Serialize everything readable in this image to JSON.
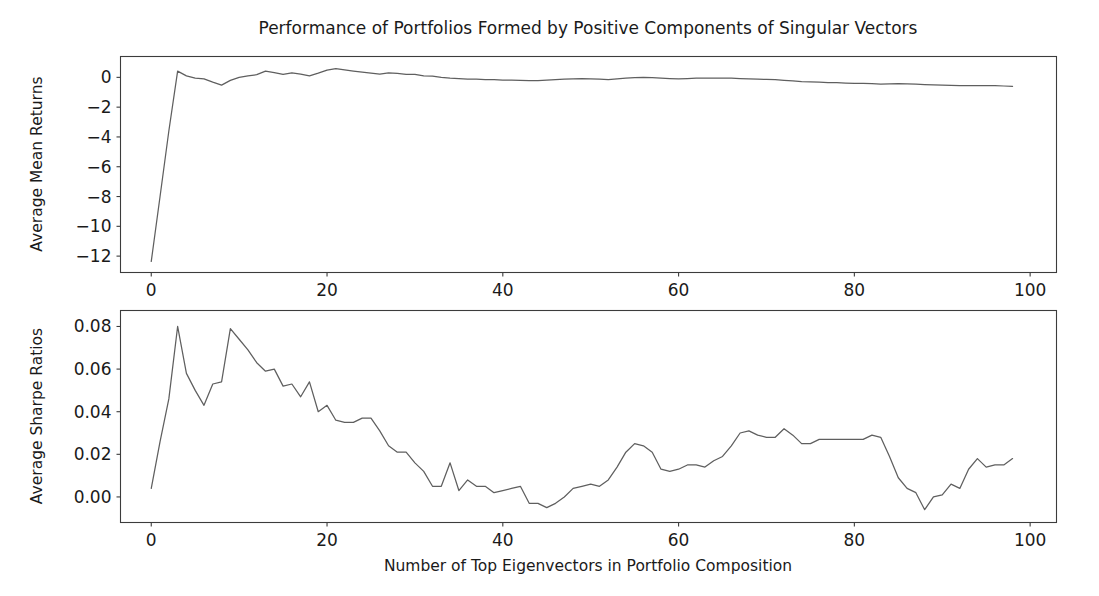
{
  "figure": {
    "title": "Performance of Portfolios Formed by Positive Components of Singular Vectors",
    "background_color": "#ffffff",
    "line_color": "#5f5f5f",
    "axis_color": "#3c3c3c"
  },
  "chart_data": [
    {
      "type": "line",
      "panel": "top",
      "title": "Performance of Portfolios Formed by Positive Components of Singular Vectors",
      "xlabel": "",
      "ylabel": "Average Mean Returns",
      "xlim": [
        -3.5,
        103
      ],
      "ylim": [
        -13.1,
        1.4
      ],
      "xticks": [
        0,
        20,
        40,
        60,
        80,
        100
      ],
      "xticklabels": [
        "0",
        "20",
        "40",
        "60",
        "80",
        "100"
      ],
      "yticks": [
        0,
        -2,
        -4,
        -6,
        -8,
        -10,
        -12
      ],
      "yticklabels": [
        "0",
        "−2",
        "−4",
        "−6",
        "−8",
        "−10",
        "−12"
      ],
      "grid": false,
      "legend": false,
      "series": [
        {
          "name": "Average Mean Returns",
          "x": [
            0,
            1,
            2,
            3,
            4,
            5,
            6,
            7,
            8,
            9,
            10,
            11,
            12,
            13,
            14,
            15,
            16,
            17,
            18,
            19,
            20,
            21,
            22,
            23,
            24,
            25,
            26,
            27,
            28,
            29,
            30,
            31,
            32,
            33,
            34,
            35,
            36,
            37,
            38,
            39,
            40,
            41,
            42,
            43,
            44,
            45,
            46,
            47,
            48,
            49,
            50,
            51,
            52,
            53,
            54,
            55,
            56,
            57,
            58,
            59,
            60,
            61,
            62,
            63,
            64,
            65,
            66,
            67,
            68,
            69,
            70,
            71,
            72,
            73,
            74,
            75,
            76,
            77,
            78,
            79,
            80,
            81,
            82,
            83,
            84,
            85,
            86,
            87,
            88,
            89,
            90,
            91,
            92,
            93,
            94,
            95,
            96,
            97,
            98
          ],
          "values": [
            -12.35,
            -8.0,
            -3.6,
            0.42,
            0.1,
            -0.05,
            -0.1,
            -0.32,
            -0.52,
            -0.2,
            0.0,
            0.1,
            0.18,
            0.42,
            0.32,
            0.2,
            0.3,
            0.22,
            0.1,
            0.28,
            0.48,
            0.58,
            0.5,
            0.42,
            0.35,
            0.28,
            0.22,
            0.3,
            0.26,
            0.2,
            0.2,
            0.1,
            0.08,
            0.0,
            -0.05,
            -0.08,
            -0.12,
            -0.12,
            -0.15,
            -0.16,
            -0.18,
            -0.18,
            -0.2,
            -0.22,
            -0.22,
            -0.18,
            -0.15,
            -0.12,
            -0.1,
            -0.08,
            -0.1,
            -0.12,
            -0.15,
            -0.1,
            -0.05,
            -0.02,
            0.0,
            -0.02,
            -0.05,
            -0.08,
            -0.1,
            -0.08,
            -0.05,
            -0.05,
            -0.05,
            -0.05,
            -0.05,
            -0.08,
            -0.1,
            -0.12,
            -0.14,
            -0.16,
            -0.2,
            -0.24,
            -0.28,
            -0.3,
            -0.32,
            -0.35,
            -0.36,
            -0.38,
            -0.4,
            -0.4,
            -0.42,
            -0.45,
            -0.44,
            -0.42,
            -0.44,
            -0.46,
            -0.48,
            -0.5,
            -0.52,
            -0.54,
            -0.55,
            -0.56,
            -0.56,
            -0.55,
            -0.56,
            -0.58,
            -0.6,
            -0.6
          ]
        }
      ]
    },
    {
      "type": "line",
      "panel": "bottom",
      "title": "",
      "xlabel": "Number of Top Eigenvectors in Portfolio Composition",
      "ylabel": "Average Sharpe Ratios",
      "xlim": [
        -3.5,
        103
      ],
      "ylim": [
        -0.012,
        0.0875
      ],
      "xticks": [
        0,
        20,
        40,
        60,
        80,
        100
      ],
      "xticklabels": [
        "0",
        "20",
        "40",
        "60",
        "80",
        "100"
      ],
      "yticks": [
        0.0,
        0.02,
        0.04,
        0.06,
        0.08
      ],
      "yticklabels": [
        "0.00",
        "0.02",
        "0.04",
        "0.06",
        "0.08"
      ],
      "grid": false,
      "legend": false,
      "series": [
        {
          "name": "Average Sharpe Ratios",
          "x": [
            0,
            1,
            2,
            3,
            4,
            5,
            6,
            7,
            8,
            9,
            10,
            11,
            12,
            13,
            14,
            15,
            16,
            17,
            18,
            19,
            20,
            21,
            22,
            23,
            24,
            25,
            26,
            27,
            28,
            29,
            30,
            31,
            32,
            33,
            34,
            35,
            36,
            37,
            38,
            39,
            40,
            41,
            42,
            43,
            44,
            45,
            46,
            47,
            48,
            49,
            50,
            51,
            52,
            53,
            54,
            55,
            56,
            57,
            58,
            59,
            60,
            61,
            62,
            63,
            64,
            65,
            66,
            67,
            68,
            69,
            70,
            71,
            72,
            73,
            74,
            75,
            76,
            77,
            78,
            79,
            80,
            81,
            82,
            83,
            84,
            85,
            86,
            87,
            88,
            89,
            90,
            91,
            92,
            93,
            94,
            95,
            96,
            97,
            98
          ],
          "values": [
            0.004,
            0.026,
            0.046,
            0.08,
            0.058,
            0.05,
            0.043,
            0.053,
            0.054,
            0.079,
            0.074,
            0.069,
            0.063,
            0.059,
            0.06,
            0.052,
            0.053,
            0.047,
            0.054,
            0.04,
            0.043,
            0.036,
            0.035,
            0.035,
            0.037,
            0.037,
            0.031,
            0.024,
            0.021,
            0.021,
            0.016,
            0.012,
            0.005,
            0.005,
            0.016,
            0.003,
            0.008,
            0.005,
            0.005,
            0.002,
            0.003,
            0.004,
            0.005,
            -0.003,
            -0.003,
            -0.005,
            -0.003,
            0.0,
            0.004,
            0.005,
            0.006,
            0.005,
            0.008,
            0.014,
            0.021,
            0.025,
            0.024,
            0.021,
            0.013,
            0.012,
            0.013,
            0.015,
            0.015,
            0.014,
            0.017,
            0.019,
            0.024,
            0.03,
            0.031,
            0.029,
            0.028,
            0.028,
            0.032,
            0.029,
            0.025,
            0.025,
            0.027,
            0.027,
            0.027,
            0.027,
            0.027,
            0.027,
            0.029,
            0.028,
            0.019,
            0.009,
            0.004,
            0.002,
            -0.006,
            0.0,
            0.001,
            0.006,
            0.004,
            0.013,
            0.018,
            0.014,
            0.015,
            0.015,
            0.018,
            0.021,
            0.015,
            0.016
          ]
        }
      ]
    }
  ]
}
